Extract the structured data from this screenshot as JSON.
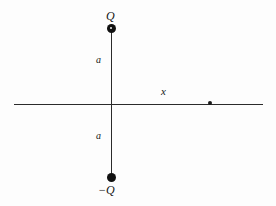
{
  "figure": {
    "background_color": "#fdfdfd",
    "line_color": "#2b2b2b",
    "marker_color": "#111111"
  },
  "labels": {
    "charge_positive": "Q",
    "charge_negative": "−Q",
    "distance_upper": "a",
    "distance_lower": "a",
    "axis_x": "x"
  },
  "elements": {
    "horizontal_axis": "x-axis",
    "vertical_axis": "dipole-axis",
    "positive_charge_marker": "filled-circle",
    "negative_charge_marker": "filled-circle",
    "field_point_marker": "small-filled-dot"
  },
  "chart_data": {
    "type": "scatter",
    "title": "",
    "xlabel": "x",
    "ylabel": "",
    "grid": false,
    "legend": null,
    "annotations": [
      {
        "text": "Q",
        "x": 0,
        "y": 1,
        "role": "positive-charge-label"
      },
      {
        "text": "−Q",
        "x": 0,
        "y": -1,
        "role": "negative-charge-label"
      },
      {
        "text": "a",
        "x": 0,
        "y": 0.5,
        "role": "upper-separation-label"
      },
      {
        "text": "a",
        "x": 0,
        "y": -0.5,
        "role": "lower-separation-label"
      },
      {
        "text": "x",
        "x": 0.65,
        "y": 0.12,
        "role": "axis-label"
      }
    ],
    "points": [
      {
        "label": "Q",
        "x": 0,
        "y": 1,
        "marker": "filled-circle",
        "size": "large"
      },
      {
        "label": "−Q",
        "x": 0,
        "y": -1,
        "marker": "filled-circle",
        "size": "large"
      },
      {
        "label": "",
        "x": 1.3,
        "y": 0,
        "marker": "filled-circle",
        "size": "small"
      }
    ],
    "lines": [
      {
        "name": "x-axis",
        "x": [
          -1.5,
          2.0
        ],
        "y": [
          0,
          0
        ]
      },
      {
        "name": "dipole-axis",
        "x": [
          0,
          0
        ],
        "y": [
          1,
          -1
        ]
      }
    ],
    "xlim": [
      -1.5,
      2.0
    ],
    "ylim": [
      -1.2,
      1.2
    ]
  }
}
